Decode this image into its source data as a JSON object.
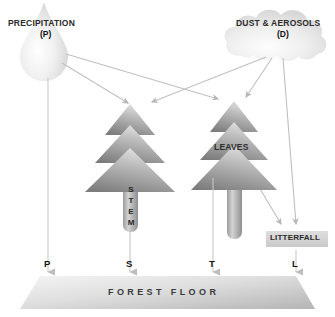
{
  "diagram": {
    "sources": {
      "precipitation": {
        "label": "PRECIPITATION",
        "symbol": "(P)",
        "shape": "raindrop"
      },
      "dust": {
        "label": "DUST & AEROSOLS",
        "symbol": "(D)",
        "shape": "cloud"
      }
    },
    "trees": {
      "left": {
        "trunk_label": "STEM",
        "trunk_label_letters": [
          "S",
          "T",
          "E",
          "M"
        ]
      },
      "right": {
        "canopy_label": "LEAVES"
      }
    },
    "litterfall": {
      "label": "LITTERFALL"
    },
    "ground": {
      "label": "FOREST FLOOR"
    },
    "fluxes": [
      {
        "id": "P",
        "letter": "P",
        "name": "precipitation-flux"
      },
      {
        "id": "S",
        "letter": "S",
        "name": "stemflow-flux"
      },
      {
        "id": "T",
        "letter": "T",
        "name": "throughfall-flux"
      },
      {
        "id": "L",
        "letter": "L",
        "name": "litterfall-flux"
      }
    ],
    "colors": {
      "background": "#ffffff",
      "tree_light": "#d8d8d8",
      "tree_dark": "#7f7f7f",
      "trunk_light": "#d2d2d2",
      "trunk_dark": "#8e8e8e",
      "cloud": "#e6e6e6",
      "drop": "#ececec",
      "arrow": "#b6b6b6",
      "ground_light": "#f0f0f0",
      "ground_dark": "#b9b9b9",
      "litterfall_box": "#d6d6d6",
      "text": "#222222"
    }
  }
}
